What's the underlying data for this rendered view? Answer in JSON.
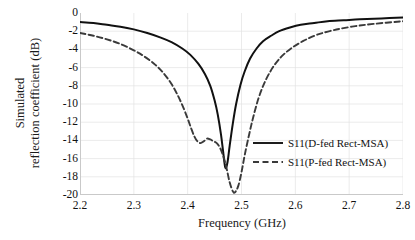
{
  "chart_data": {
    "type": "line",
    "title": "",
    "xlabel": "Frequency (GHz)",
    "ylabel_line1": "Simulated",
    "ylabel_line2": "reflection coefficient (dB)",
    "xlim": [
      2.2,
      2.8
    ],
    "ylim": [
      -20,
      0
    ],
    "xticks": [
      "2.2",
      "2.3",
      "2.4",
      "2.5",
      "2.6",
      "2.7",
      "2.8"
    ],
    "xtick_values": [
      2.2,
      2.3,
      2.4,
      2.5,
      2.6,
      2.7,
      2.8
    ],
    "yticks": [
      "0",
      "-2",
      "-4",
      "-6",
      "-8",
      "-10",
      "-12",
      "-14",
      "-16",
      "-18",
      "-20"
    ],
    "ytick_values": [
      0,
      -2,
      -4,
      -6,
      -8,
      -10,
      -12,
      -14,
      -16,
      -18,
      -20
    ],
    "grid": "horizontal-and-vertical-faint",
    "legend_position": "center-right-inside",
    "line_color": "#1a1a1a",
    "grid_color": "#e2e2e2",
    "series": [
      {
        "name": "S11(D-fed Rect-MSA)",
        "style": "solid",
        "color": "#111111",
        "x": [
          2.2,
          2.225,
          2.25,
          2.275,
          2.3,
          2.325,
          2.35,
          2.37,
          2.39,
          2.405,
          2.42,
          2.432,
          2.442,
          2.45,
          2.456,
          2.462,
          2.466,
          2.47,
          2.474,
          2.478,
          2.484,
          2.49,
          2.498,
          2.506,
          2.516,
          2.528,
          2.54,
          2.555,
          2.57,
          2.59,
          2.61,
          2.635,
          2.66,
          2.69,
          2.72,
          2.76,
          2.8
        ],
        "y": [
          -1.0,
          -1.1,
          -1.3,
          -1.5,
          -1.8,
          -2.2,
          -2.7,
          -3.2,
          -3.9,
          -4.6,
          -5.6,
          -6.7,
          -8.0,
          -9.6,
          -11.2,
          -13.4,
          -15.3,
          -17.0,
          -16.4,
          -14.6,
          -12.1,
          -10.0,
          -7.9,
          -6.4,
          -5.0,
          -3.9,
          -3.1,
          -2.5,
          -2.0,
          -1.6,
          -1.3,
          -1.1,
          -0.9,
          -0.8,
          -0.7,
          -0.6,
          -0.5
        ]
      },
      {
        "name": "S11(P-fed Rect-MSA)",
        "style": "dashed",
        "color": "#3a3a3a",
        "x": [
          2.2,
          2.225,
          2.25,
          2.275,
          2.3,
          2.32,
          2.34,
          2.355,
          2.37,
          2.382,
          2.392,
          2.4,
          2.406,
          2.412,
          2.418,
          2.424,
          2.43,
          2.436,
          2.442,
          2.448,
          2.454,
          2.46,
          2.466,
          2.472,
          2.478,
          2.484,
          2.488,
          2.494,
          2.5,
          2.506,
          2.514,
          2.522,
          2.532,
          2.544,
          2.558,
          2.574,
          2.592,
          2.614,
          2.64,
          2.67,
          2.705,
          2.745,
          2.8
        ],
        "y": [
          -2.2,
          -2.5,
          -2.9,
          -3.4,
          -4.1,
          -4.8,
          -5.7,
          -6.6,
          -7.8,
          -9.1,
          -10.4,
          -11.6,
          -12.6,
          -13.5,
          -14.1,
          -14.3,
          -14.1,
          -13.8,
          -13.9,
          -14.1,
          -14.3,
          -14.8,
          -15.7,
          -17.0,
          -18.6,
          -19.6,
          -19.7,
          -19.0,
          -17.5,
          -15.6,
          -13.4,
          -11.4,
          -9.3,
          -7.5,
          -6.0,
          -4.8,
          -3.9,
          -3.1,
          -2.4,
          -1.9,
          -1.5,
          -1.2,
          -0.9
        ]
      }
    ],
    "markers": {
      "solid_min_freq": 2.47,
      "solid_min_value": -17.0,
      "dashed_min_freq": 2.488,
      "dashed_min_value": -19.7
    }
  },
  "legend": {
    "items": [
      {
        "label": "S11(D-fed Rect-MSA)",
        "style": "solid"
      },
      {
        "label": "S11(P-fed Rect-MSA)",
        "style": "dashed"
      }
    ]
  }
}
